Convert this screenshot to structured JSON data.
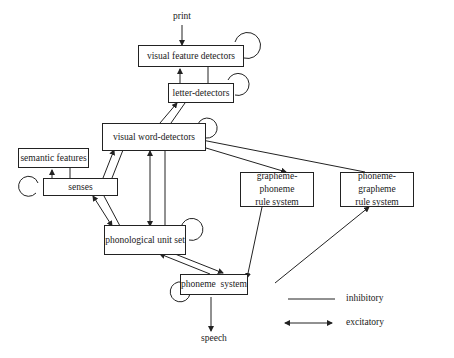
{
  "diagram": {
    "nodes": {
      "visual_feature_detectors": "visual feature detectors",
      "letter_detectors": "letter-detectors",
      "visual_word_detectors": "visual word-detectors",
      "semantic_features": "semantic features",
      "senses": "senses",
      "grapheme_phoneme_line1": "grapheme-phoneme",
      "grapheme_phoneme_line2": "rule system",
      "phoneme_grapheme_line1": "phoneme-grapheme",
      "phoneme_grapheme_line2": "rule system",
      "phonological_unit_set": "phonological unit set",
      "phoneme_system": "phoneme  system"
    },
    "io": {
      "input": "print",
      "output": "speech"
    },
    "legend": {
      "inhibitory": "inhibitory",
      "excitatory": "excitatory"
    }
  }
}
